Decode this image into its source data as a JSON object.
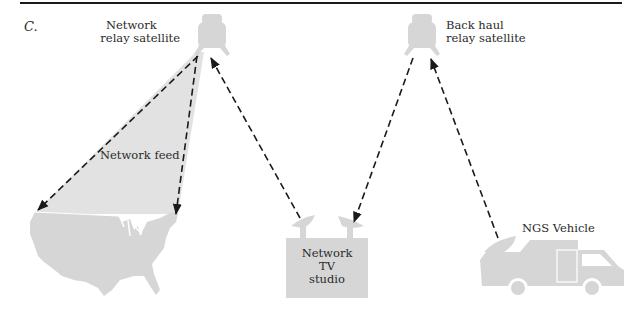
{
  "figure": {
    "panel_label": "C.",
    "colors": {
      "shape_fill": "#d6d6d6",
      "beam_fill": "#e2e2e2",
      "line": "#1a1a1a",
      "text": "#2a2a2a"
    }
  },
  "nodes": {
    "network_satellite": {
      "label_line1": "Network",
      "label_line2": "relay satellite",
      "icon": "satellite-icon"
    },
    "backhaul_satellite": {
      "label_line1": "Back haul",
      "label_line2": "relay satellite",
      "icon": "satellite-icon"
    },
    "studio": {
      "label_line1": "Network",
      "label_line2": "TV",
      "label_line3": "studio",
      "icon": "building-with-dishes-icon"
    },
    "vehicle": {
      "label": "NGS Vehicle",
      "icon": "van-with-dish-icon"
    },
    "usa": {
      "icon": "us-map-icon"
    }
  },
  "beam": {
    "label": "Network feed"
  },
  "links": [
    {
      "from": "studio",
      "to": "network_satellite",
      "style": "dashed-arrow"
    },
    {
      "from": "backhaul_satellite",
      "to": "studio",
      "style": "dashed-arrow"
    },
    {
      "from": "vehicle",
      "to": "backhaul_satellite",
      "style": "dashed-arrow"
    },
    {
      "from": "network_satellite",
      "to": "usa-west",
      "style": "dashed-arrow"
    },
    {
      "from": "network_satellite",
      "to": "usa-east",
      "style": "dashed-arrow"
    }
  ]
}
